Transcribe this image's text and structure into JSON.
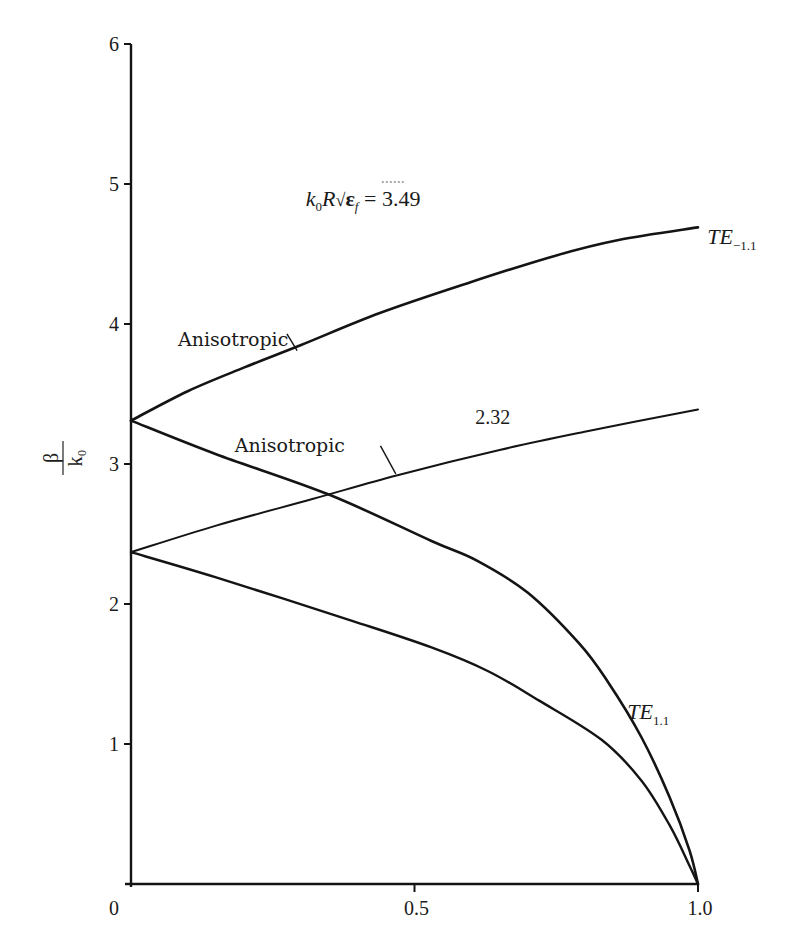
{
  "chart_data": {
    "type": "line",
    "title": "",
    "xlabel": "",
    "ylabel": "β / k₀",
    "ylabel_numerator": "β",
    "ylabel_denominator": "k₀",
    "xlim": [
      0,
      1.0
    ],
    "ylim": [
      0,
      6
    ],
    "grid": false,
    "legend": "none (inline curve annotations)",
    "x_ticks": [
      0,
      0.5,
      1.0
    ],
    "x_tick_labels": [
      "0",
      "0.5",
      "1.0"
    ],
    "y_ticks": [
      1,
      2,
      3,
      4,
      5,
      6
    ],
    "y_tick_labels": [
      "1",
      "2",
      "3",
      "4",
      "5",
      "6"
    ],
    "series": [
      {
        "name": "TE-1,1 (k0R√εf = 3.49, anisotropic branch)",
        "group": "3.49",
        "mode": "TE-1.1",
        "x": [
          0,
          0.1,
          0.2,
          0.3,
          0.44,
          0.6,
          0.75,
          0.86,
          1.0
        ],
        "y": [
          3.31,
          3.52,
          3.69,
          3.85,
          4.08,
          4.3,
          4.49,
          4.6,
          4.69
        ],
        "stroke_width": 2.6
      },
      {
        "name": "TE1,1 (k0R√εf = 3.49)",
        "group": "3.49",
        "mode": "TE1.1",
        "x": [
          0,
          0.15,
          0.35,
          0.53,
          0.61,
          0.7,
          0.79,
          0.84,
          0.9,
          0.95,
          0.985,
          1.0
        ],
        "y": [
          3.31,
          3.07,
          2.78,
          2.45,
          2.31,
          2.08,
          1.72,
          1.45,
          1.05,
          0.62,
          0.24,
          0.0
        ],
        "stroke_width": 2.6
      },
      {
        "name": "TE-1,1 (k0R√εf = 2.32, anisotropic branch)",
        "group": "2.32",
        "mode": "TE-1.1",
        "x": [
          0,
          0.15,
          0.32,
          0.47,
          0.65,
          0.8,
          1.0
        ],
        "y": [
          2.37,
          2.56,
          2.75,
          2.92,
          3.1,
          3.23,
          3.39
        ],
        "stroke_width": 2.0
      },
      {
        "name": "TE1,1 (k0R√εf = 2.32)",
        "group": "2.32",
        "mode": "TE1.1",
        "x": [
          0,
          0.15,
          0.39,
          0.53,
          0.63,
          0.72,
          0.83,
          0.9,
          0.95,
          0.985,
          1.0
        ],
        "y": [
          2.37,
          2.19,
          1.88,
          1.69,
          1.52,
          1.31,
          1.03,
          0.74,
          0.42,
          0.13,
          0.0
        ],
        "stroke_width": 2.4
      }
    ],
    "annotations": [
      {
        "id": "param-349",
        "text_prefix": "k",
        "text_sub0": "0",
        "text_mid": "R",
        "text_sqrt": "√",
        "text_eps": "ε",
        "text_sub_f": "f",
        "text_value": " = 3.49",
        "full_text": "k0R√εf = 3.49",
        "x": 0.52,
        "y": 4.9
      },
      {
        "id": "mode-te-minus",
        "main": "TE",
        "sub": "−1.1",
        "x": 1.02,
        "y": 4.66
      },
      {
        "id": "param-232",
        "text": "2.32",
        "x": 0.66,
        "y": 3.34
      },
      {
        "id": "mode-te-plus",
        "main": "TE",
        "sub": "1.1",
        "x": 0.87,
        "y": 1.28
      },
      {
        "id": "aniso-upper",
        "text": "Anisotropic",
        "x": 0.09,
        "y": 3.9,
        "leader_from": [
          0.275,
          3.93
        ],
        "leader_to": [
          0.293,
          3.81
        ]
      },
      {
        "id": "aniso-lower",
        "text": "Anisotropic",
        "x": 0.19,
        "y": 3.14,
        "leader_from": [
          0.44,
          3.13
        ],
        "leader_to": [
          0.467,
          2.93
        ]
      }
    ]
  }
}
